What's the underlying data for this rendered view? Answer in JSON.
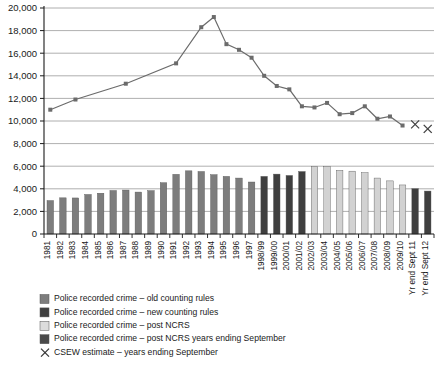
{
  "chart_data": {
    "type": "bar",
    "title": "",
    "xlabel": "",
    "ylabel": "",
    "ylim": [
      0,
      20000
    ],
    "ytick_step": 2000,
    "grid": true,
    "legend_position": "bottom-left",
    "yticks": [
      "0",
      "2,000",
      "4,000",
      "6,000",
      "8,000",
      "10,000",
      "12,000",
      "14,000",
      "16,000",
      "18,000",
      "20,000"
    ],
    "categories": [
      "1981",
      "1982",
      "1983",
      "1984",
      "1985",
      "1986",
      "1987",
      "1988",
      "1989",
      "1990",
      "1991",
      "1992",
      "1993",
      "1994",
      "1995",
      "1996",
      "1997",
      "1998/99",
      "1999/00",
      "2000/01",
      "2001/02",
      "2002/03",
      "2003/04",
      "2004/05",
      "2005/06",
      "2006/07",
      "2007/08",
      "2008/09",
      "2009/10",
      "Yr end Sept 11",
      "Yr end Sept 12"
    ],
    "series": [
      {
        "name": "Police recorded crime – old counting rules",
        "type": "bar",
        "color": "#7d7d7d",
        "values": [
          2960,
          3200,
          3190,
          3500,
          3610,
          3850,
          3890,
          3710,
          3840,
          4540,
          5280,
          5590,
          5530,
          5250,
          5100,
          4950,
          4600,
          null,
          null,
          null,
          null,
          null,
          null,
          null,
          null,
          null,
          null,
          null,
          null,
          null,
          null
        ]
      },
      {
        "name": "Police recorded crime – new counting rules",
        "type": "bar",
        "color": "#3f3f3f",
        "values": [
          null,
          null,
          null,
          null,
          null,
          null,
          null,
          null,
          null,
          null,
          null,
          null,
          null,
          null,
          null,
          null,
          null,
          5100,
          5300,
          5180,
          5530,
          null,
          null,
          null,
          null,
          null,
          null,
          null,
          null,
          null,
          null
        ]
      },
      {
        "name": "Police recorded crime – post NCRS",
        "type": "bar",
        "color": "#d2d2d2",
        "values": [
          null,
          null,
          null,
          null,
          null,
          null,
          null,
          null,
          null,
          null,
          null,
          null,
          null,
          null,
          null,
          null,
          null,
          null,
          null,
          null,
          null,
          5970,
          5950,
          5640,
          5560,
          5430,
          4950,
          4700,
          4340,
          null,
          null
        ]
      },
      {
        "name": "Police recorded crime – post NCRS years ending September",
        "type": "bar",
        "color": "#3f3f3f",
        "values": [
          null,
          null,
          null,
          null,
          null,
          null,
          null,
          null,
          null,
          null,
          null,
          null,
          null,
          null,
          null,
          null,
          null,
          null,
          null,
          null,
          null,
          null,
          null,
          null,
          null,
          null,
          null,
          null,
          null,
          4010,
          3800
        ]
      },
      {
        "name": "CSEW estimate – years ending September",
        "type": "line",
        "color": "#6b6b6b",
        "marker": "square",
        "values": [
          11000,
          null,
          11900,
          null,
          null,
          null,
          13300,
          null,
          null,
          null,
          15100,
          null,
          18300,
          19200,
          16800,
          16300,
          15600,
          14000,
          13100,
          12800,
          11300,
          11200,
          11600,
          10600,
          10700,
          11300,
          10200,
          10400,
          9600,
          null,
          null
        ]
      },
      {
        "name": "CSEW estimate – years ending September (X)",
        "type": "scatter",
        "color": "#3f3f3f",
        "marker": "x",
        "values": [
          null,
          null,
          null,
          null,
          null,
          null,
          null,
          null,
          null,
          null,
          null,
          null,
          null,
          null,
          null,
          null,
          null,
          null,
          null,
          null,
          null,
          null,
          null,
          null,
          null,
          null,
          null,
          null,
          null,
          9700,
          9300
        ]
      }
    ]
  },
  "legend": {
    "items": [
      {
        "label": "Police recorded crime – old counting rules",
        "swatch": "#7d7d7d",
        "marker": "square"
      },
      {
        "label": "Police recorded crime – new counting rules",
        "swatch": "#3f3f3f",
        "marker": "square"
      },
      {
        "label": "Police recorded crime – post NCRS",
        "swatch": "#dcdcdc",
        "marker": "square"
      },
      {
        "label": "Police recorded crime – post NCRS years ending September",
        "swatch": "#4a4a4a",
        "marker": "square"
      },
      {
        "label": "CSEW estimate – years ending September",
        "swatch": "#333333",
        "marker": "x"
      }
    ]
  }
}
